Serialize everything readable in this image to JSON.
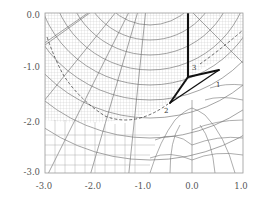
{
  "figure": {
    "type": "conformal-map-grid",
    "x_axis": {
      "min": -3.0,
      "max": 1.0,
      "ticks": [
        "-3.0",
        "-2.0",
        "-1.0",
        "0.0",
        "1.0"
      ]
    },
    "y_axis": {
      "min": -3.0,
      "max": 0.0,
      "ticks": [
        "0.0",
        "-1.0",
        "-2.0",
        "-3.0"
      ]
    },
    "polygon": {
      "vertex_labels": [
        "3",
        "1",
        "2"
      ],
      "stroke_color": "#111111"
    },
    "grid_color": "#555555",
    "fine_grid_color": "#9a9a9a",
    "dashed_color": "#444444"
  }
}
